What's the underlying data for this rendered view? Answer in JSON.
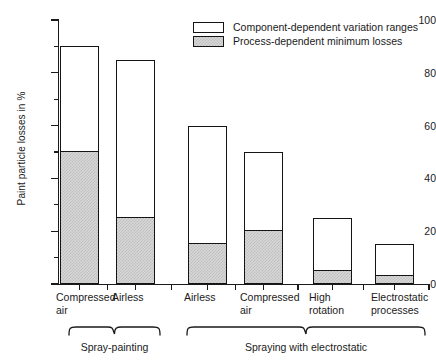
{
  "chart_data": {
    "type": "bar",
    "title": "",
    "subtitle": "",
    "xlabel": "",
    "ylabel": "Paint particle losses in %",
    "ylim": [
      0,
      100
    ],
    "ytick_labels": [
      "0",
      "20",
      "40",
      "60",
      "80",
      "100"
    ],
    "ytick_values": [
      0,
      20,
      40,
      60,
      80,
      100
    ],
    "yminor_values": [
      10,
      30,
      50,
      70,
      90
    ],
    "grid": false,
    "stacked": true,
    "legend_position": "top-right",
    "categories": [
      "Compressed\nair",
      "Airless",
      "Airless",
      "Compressed\nair",
      "High\nrotation",
      "Electrostatic\nprocesses"
    ],
    "series": [
      {
        "name": "Process-dependent minimum losses",
        "values": [
          50,
          25,
          15,
          20,
          5,
          3
        ]
      },
      {
        "name": "Component-dependent variation ranges",
        "values": [
          40,
          60,
          45,
          30,
          20,
          12
        ]
      }
    ],
    "bar_totals": [
      90,
      85,
      60,
      50,
      25,
      15
    ],
    "groups": [
      {
        "label": "Spray-painting",
        "categories": [
          0,
          1
        ]
      },
      {
        "label": "Spraying with electrostatic",
        "categories": [
          2,
          3,
          4,
          5
        ]
      }
    ],
    "colors": {
      "variation_range_fill": "#ffffff",
      "minimum_loss_fill": "#d7d7d7",
      "outline": "#141414",
      "axis": "#1a1a1a"
    }
  },
  "legend": {
    "items": [
      {
        "swatch": "open-box",
        "label": "Component-dependent variation ranges"
      },
      {
        "swatch": "hatched-box",
        "label": "Process-dependent minimum losses"
      }
    ]
  },
  "axis": {
    "y_title": "Paint particle losses in %"
  }
}
